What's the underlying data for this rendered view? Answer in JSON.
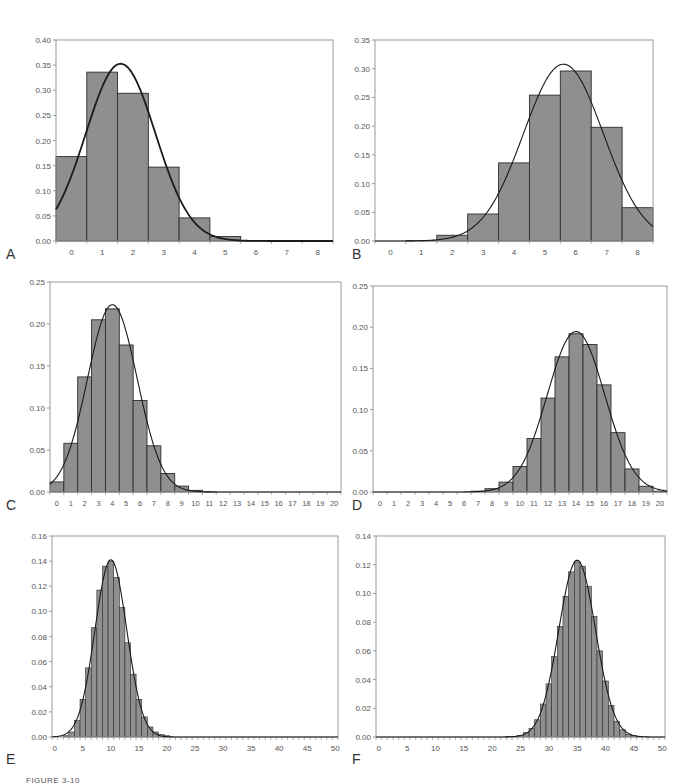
{
  "figure": {
    "caption": "FIGURE 3-10",
    "colors": {
      "bar_fill": "#8f8f8f",
      "bar_stroke": "#2e2e2e",
      "axis": "#9a9a9a",
      "curve": "#1a1a1a",
      "tick_text": "#555555"
    }
  },
  "chart_data": [
    {
      "id": "A",
      "label": "A",
      "type": "bar",
      "title": "",
      "xlabel": "",
      "ylabel": "",
      "box": {
        "left": 56,
        "top": 40,
        "right": 333,
        "bottom": 241
      },
      "ylim": [
        0,
        0.4
      ],
      "yticks": [
        "0.00",
        "0.05",
        "0.10",
        "0.15",
        "0.20",
        "0.25",
        "0.30",
        "0.35",
        "0.40"
      ],
      "categories": [
        0,
        1,
        2,
        3,
        4,
        5,
        6,
        7,
        8
      ],
      "x_tick_labels": [
        "0",
        "1",
        "2",
        "3",
        "4",
        "5",
        "6",
        "7",
        "8"
      ],
      "values": [
        0.168,
        0.336,
        0.294,
        0.147,
        0.046,
        0.009,
        0.001,
        0.0,
        0.0
      ],
      "curve": {
        "kind": "normal",
        "mean": 1.6,
        "sd": 1.131,
        "thick": true
      },
      "grid": false,
      "legend": "none"
    },
    {
      "id": "B",
      "label": "B",
      "type": "bar",
      "title": "",
      "xlabel": "",
      "ylabel": "",
      "box": {
        "left": 375,
        "top": 40,
        "right": 653,
        "bottom": 241
      },
      "ylim": [
        0,
        0.35
      ],
      "yticks": [
        "0.00",
        "0.05",
        "0.10",
        "0.15",
        "0.20",
        "0.25",
        "0.30",
        "0.35"
      ],
      "categories": [
        0,
        1,
        2,
        3,
        4,
        5,
        6,
        7,
        8
      ],
      "x_tick_labels": [
        "0",
        "1",
        "2",
        "3",
        "4",
        "5",
        "6",
        "7",
        "8"
      ],
      "values": [
        0.0001,
        0.001,
        0.01,
        0.047,
        0.136,
        0.254,
        0.296,
        0.198,
        0.058
      ],
      "curve": {
        "kind": "normal",
        "mean": 5.6,
        "sd": 1.296,
        "thick": false
      },
      "grid": false,
      "legend": "none"
    },
    {
      "id": "C",
      "label": "C",
      "type": "bar",
      "title": "",
      "xlabel": "",
      "ylabel": "",
      "box": {
        "left": 50,
        "top": 282,
        "right": 341,
        "bottom": 492
      },
      "ylim": [
        0,
        0.25
      ],
      "yticks": [
        "0.00",
        "0.05",
        "0.10",
        "0.15",
        "0.20",
        "0.25"
      ],
      "categories": [
        0,
        1,
        2,
        3,
        4,
        5,
        6,
        7,
        8,
        9,
        10,
        11,
        12,
        13,
        14,
        15,
        16,
        17,
        18,
        19,
        20
      ],
      "x_tick_labels": [
        "0",
        "1",
        "2",
        "3",
        "4",
        "5",
        "6",
        "7",
        "8",
        "9",
        "10",
        "11",
        "12",
        "13",
        "14",
        "15",
        "16",
        "17",
        "18",
        "19",
        "20"
      ],
      "values": [
        0.012,
        0.058,
        0.137,
        0.205,
        0.218,
        0.175,
        0.109,
        0.055,
        0.022,
        0.007,
        0.002,
        0.0005,
        0.0001,
        0,
        0,
        0,
        0,
        0,
        0,
        0,
        0
      ],
      "curve": {
        "kind": "normal",
        "mean": 4.0,
        "sd": 1.789,
        "thick": false
      },
      "grid": false,
      "legend": "none"
    },
    {
      "id": "D",
      "label": "D",
      "type": "bar",
      "title": "",
      "xlabel": "",
      "ylabel": "",
      "box": {
        "left": 373,
        "top": 286,
        "right": 667,
        "bottom": 492
      },
      "ylim": [
        0,
        0.25
      ],
      "yticks": [
        "0.00",
        "0.05",
        "0.10",
        "0.15",
        "0.20",
        "0.25"
      ],
      "categories": [
        0,
        1,
        2,
        3,
        4,
        5,
        6,
        7,
        8,
        9,
        10,
        11,
        12,
        13,
        14,
        15,
        16,
        17,
        18,
        19,
        20
      ],
      "x_tick_labels": [
        "0",
        "1",
        "2",
        "3",
        "4",
        "5",
        "6",
        "7",
        "8",
        "9",
        "10",
        "11",
        "12",
        "13",
        "14",
        "15",
        "16",
        "17",
        "18",
        "19",
        "20"
      ],
      "values": [
        0,
        0,
        0,
        0,
        0,
        0,
        0.0002,
        0.001,
        0.004,
        0.012,
        0.031,
        0.065,
        0.114,
        0.164,
        0.192,
        0.179,
        0.13,
        0.072,
        0.028,
        0.007,
        0.001
      ],
      "curve": {
        "kind": "normal",
        "mean": 14.0,
        "sd": 2.049,
        "thick": false
      },
      "grid": false,
      "legend": "none"
    },
    {
      "id": "E",
      "label": "E",
      "type": "bar",
      "title": "",
      "xlabel": "",
      "ylabel": "",
      "box": {
        "left": 52,
        "top": 536,
        "right": 338,
        "bottom": 737
      },
      "ylim": [
        0,
        0.16
      ],
      "yticks": [
        "0.00",
        "0.02",
        "0.04",
        "0.06",
        "0.08",
        "0.10",
        "0.12",
        "0.14",
        "0.16"
      ],
      "categories": [
        0,
        1,
        2,
        3,
        4,
        5,
        6,
        7,
        8,
        9,
        10,
        11,
        12,
        13,
        14,
        15,
        16,
        17,
        18,
        19,
        20,
        21,
        22,
        23,
        24,
        25,
        26,
        27,
        28,
        29,
        30,
        31,
        32,
        33,
        34,
        35,
        36,
        37,
        38,
        39,
        40,
        41,
        42,
        43,
        44,
        45,
        46,
        47,
        48,
        49,
        50
      ],
      "x_tick_labels": [
        "0",
        "5",
        "10",
        "15",
        "20",
        "25",
        "30",
        "35",
        "40",
        "45",
        "50"
      ],
      "x_tick_label_step": 5,
      "values": [
        1e-05,
        0.0002,
        0.001,
        0.004,
        0.013,
        0.03,
        0.055,
        0.087,
        0.117,
        0.136,
        0.14,
        0.127,
        0.103,
        0.075,
        0.05,
        0.03,
        0.016,
        0.008,
        0.004,
        0.002,
        0.001,
        0.0003,
        0.0001,
        0,
        0,
        0,
        0,
        0,
        0,
        0,
        0,
        0,
        0,
        0,
        0,
        0,
        0,
        0,
        0,
        0,
        0,
        0,
        0,
        0,
        0,
        0,
        0,
        0,
        0,
        0,
        0
      ],
      "curve": {
        "kind": "normal",
        "mean": 10.0,
        "sd": 2.828,
        "thick": false
      },
      "grid": false,
      "legend": "none"
    },
    {
      "id": "F",
      "label": "F",
      "type": "bar",
      "title": "",
      "xlabel": "",
      "ylabel": "",
      "box": {
        "left": 376,
        "top": 536,
        "right": 665,
        "bottom": 737
      },
      "ylim": [
        0,
        0.14
      ],
      "yticks": [
        "0.00",
        "0.02",
        "0.04",
        "0.06",
        "0.08",
        "0.10",
        "0.12",
        "0.14"
      ],
      "categories": [
        0,
        1,
        2,
        3,
        4,
        5,
        6,
        7,
        8,
        9,
        10,
        11,
        12,
        13,
        14,
        15,
        16,
        17,
        18,
        19,
        20,
        21,
        22,
        23,
        24,
        25,
        26,
        27,
        28,
        29,
        30,
        31,
        32,
        33,
        34,
        35,
        36,
        37,
        38,
        39,
        40,
        41,
        42,
        43,
        44,
        45,
        46,
        47,
        48,
        49,
        50
      ],
      "x_tick_labels": [
        "0",
        "5",
        "10",
        "15",
        "20",
        "25",
        "30",
        "35",
        "40",
        "45",
        "50"
      ],
      "x_tick_label_step": 5,
      "values": [
        0,
        0,
        0,
        0,
        0,
        0,
        0,
        0,
        0,
        0,
        0,
        0,
        0,
        0,
        0,
        0,
        0,
        0,
        0,
        0,
        0,
        0,
        0.0001,
        0.0003,
        0.0005,
        0.001,
        0.003,
        0.006,
        0.012,
        0.023,
        0.037,
        0.056,
        0.077,
        0.098,
        0.115,
        0.122,
        0.119,
        0.105,
        0.084,
        0.06,
        0.039,
        0.022,
        0.011,
        0.005,
        0.002,
        0.001,
        0.0003,
        0.0001,
        0,
        0,
        0
      ],
      "curve": {
        "kind": "normal",
        "mean": 35.0,
        "sd": 3.24,
        "thick": false
      },
      "grid": false,
      "legend": "none"
    }
  ]
}
